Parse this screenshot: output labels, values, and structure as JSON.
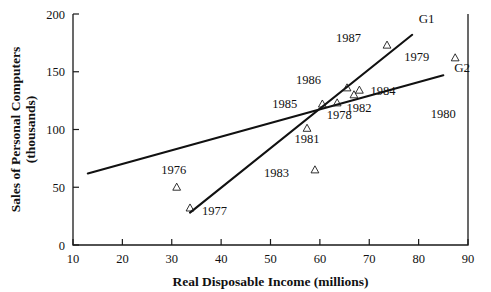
{
  "chart_data": {
    "type": "scatter",
    "title": "",
    "xlabel": "Real Disposable Income (millions)",
    "ylabel_line1": "Sales of Personal Computers",
    "ylabel_line2": "(thousands)",
    "xlim": [
      10,
      90
    ],
    "ylim": [
      0,
      200
    ],
    "xticks": [
      10,
      20,
      30,
      40,
      50,
      60,
      70,
      80,
      90
    ],
    "yticks": [
      0,
      50,
      100,
      150,
      200
    ],
    "xtick_labels": [
      "10",
      "20",
      "30",
      "40",
      "50",
      "60",
      "70",
      "80",
      "90"
    ],
    "ytick_labels": [
      "0",
      "50",
      "100",
      "150",
      "200"
    ],
    "grid": false,
    "legend_position": "inline-right",
    "marker_style": "open-triangle",
    "points": [
      {
        "label": "1976",
        "x": 31.0,
        "y": 50,
        "label_dx": -3,
        "label_dy": -13,
        "has_marker": true
      },
      {
        "label": "1977",
        "x": 33.7,
        "y": 32,
        "label_dx": 12,
        "label_dy": 7,
        "has_marker": true
      },
      {
        "label": "1981",
        "x": 57.4,
        "y": 101,
        "label_dx": 0,
        "label_dy": 15,
        "has_marker": true
      },
      {
        "label": "1983",
        "x": 59.0,
        "y": 65,
        "label_dx": -26,
        "label_dy": 7,
        "has_marker": true
      },
      {
        "label": "1985",
        "x": 60.5,
        "y": 122,
        "label_dx": -25,
        "label_dy": 4,
        "has_marker": true
      },
      {
        "label": "1978",
        "x": 63.5,
        "y": 123,
        "label_dx": 2,
        "label_dy": 16,
        "has_marker": true
      },
      {
        "label": "1986",
        "x": 65.5,
        "y": 136,
        "label_dx": -26,
        "label_dy": -4,
        "has_marker": true
      },
      {
        "label": "1982",
        "x": 66.9,
        "y": 130,
        "label_dx": 5,
        "label_dy": 17,
        "has_marker": true
      },
      {
        "label": "1984",
        "x": 68.0,
        "y": 134,
        "label_dx": 11,
        "label_dy": 5,
        "has_marker": true
      },
      {
        "label": "1987",
        "x": 73.6,
        "y": 173,
        "label_dx": -26,
        "label_dy": -3,
        "has_marker": true
      },
      {
        "label": "1979",
        "x": 87.4,
        "y": 162,
        "label_dx": -26,
        "label_dy": 3,
        "has_marker": true
      },
      {
        "label": "1980",
        "x": 85.0,
        "y": 110,
        "label_dx": 0,
        "label_dy": 0,
        "has_marker": false
      }
    ],
    "series": [
      {
        "name": "G1",
        "type": "line",
        "x": [
          33.7,
          78.7
        ],
        "y": [
          28,
          182
        ],
        "label": "G1",
        "label_x": 80.0,
        "label_y": 192
      },
      {
        "name": "G2",
        "type": "line",
        "x": [
          13.0,
          85.0
        ],
        "y": [
          62,
          147
        ],
        "label": "G2",
        "label_x": 87.2,
        "label_y": 150
      }
    ]
  }
}
